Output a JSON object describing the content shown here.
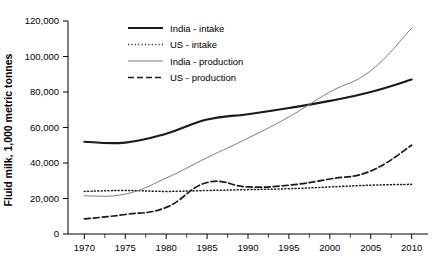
{
  "chart_data": {
    "type": "line",
    "title": "",
    "xlabel": "",
    "ylabel": "Fluid milk, 1,000 metric tonnes",
    "x": [
      1970,
      1975,
      1980,
      1985,
      1990,
      1995,
      2000,
      2005,
      2010
    ],
    "xticklabels": [
      "1970",
      "1975",
      "1980",
      "1985",
      "1990",
      "1995",
      "2000",
      "2005",
      "2010"
    ],
    "yticks": [
      0,
      20000,
      40000,
      60000,
      80000,
      100000,
      120000
    ],
    "yticklabels": [
      "0",
      "20,000",
      "40,000",
      "60,000",
      "80,000",
      "100,000",
      "120,000"
    ],
    "xlim": [
      1968,
      2012
    ],
    "ylim": [
      0,
      120000
    ],
    "grid": false,
    "legend_position": "top-center",
    "series": [
      {
        "name": "India - intake",
        "style": "solid-thick",
        "color": "#1a1a1a",
        "values": [
          52000,
          51500,
          56500,
          64500,
          67500,
          71000,
          75000,
          80000,
          87000
        ]
      },
      {
        "name": "US - intake",
        "style": "dotted",
        "color": "#1a1a1a",
        "values": [
          24000,
          24500,
          24000,
          24500,
          25000,
          25500,
          26500,
          27500,
          28000
        ]
      },
      {
        "name": "India - production",
        "style": "solid-thin",
        "color": "#7d7d7d",
        "values": [
          21500,
          22500,
          31500,
          43000,
          54000,
          66000,
          80000,
          92000,
          116000
        ]
      },
      {
        "name": "US - production",
        "style": "dashed",
        "color": "#1a1a1a",
        "values": [
          8500,
          11000,
          15000,
          29000,
          26500,
          27500,
          31000,
          35500,
          50000
        ]
      }
    ]
  },
  "legend": {
    "items": [
      {
        "label": "India - intake"
      },
      {
        "label": "US - intake"
      },
      {
        "label": "India - production"
      },
      {
        "label": "US - production"
      }
    ]
  }
}
